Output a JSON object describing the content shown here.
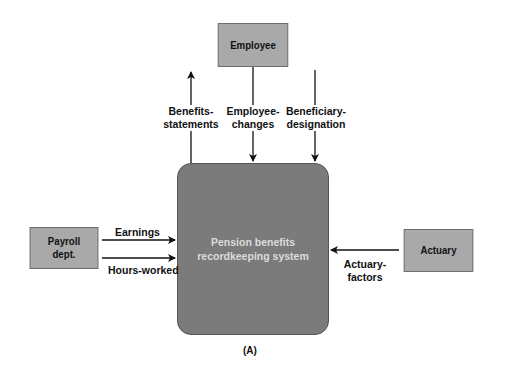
{
  "diagram": {
    "type": "context-diagram",
    "process": {
      "label_line1": "Pension benefits",
      "label_line2": "recordkeeping system"
    },
    "entities": {
      "employee": {
        "label": "Employee"
      },
      "payroll": {
        "label_line1": "Payroll",
        "label_line2": "dept."
      },
      "actuary": {
        "label": "Actuary"
      }
    },
    "flows": {
      "benefits_statements": {
        "line1": "Benefits-",
        "line2": "statements",
        "from": "system",
        "to": "Employee"
      },
      "employee_changes": {
        "line1": "Employee-",
        "line2": "changes",
        "from": "Employee",
        "to": "system"
      },
      "beneficiary_designation": {
        "line1": "Beneficiary-",
        "line2": "designation",
        "from": "Employee",
        "to": "system"
      },
      "earnings": {
        "label": "Earnings",
        "from": "Payroll dept.",
        "to": "system"
      },
      "hours_worked": {
        "label": "Hours-worked",
        "from": "Payroll dept.",
        "to": "system"
      },
      "actuary_factors": {
        "line1": "Actuary-",
        "line2": "factors",
        "from": "Actuary",
        "to": "system"
      }
    },
    "caption": "(A)"
  }
}
